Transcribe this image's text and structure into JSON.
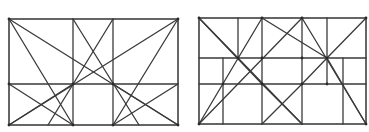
{
  "colors": {
    "line": "#3a3a3a",
    "background": "#ffffff"
  },
  "diagrams": [
    {
      "name": "left-construction-diagram",
      "frame": {
        "x": 9,
        "y": 19,
        "w": 169,
        "h": 106
      },
      "lines": [
        [
          73,
          19,
          73,
          125
        ],
        [
          113,
          19,
          113,
          125
        ],
        [
          9,
          84,
          178,
          84
        ],
        [
          9,
          19,
          178,
          125
        ],
        [
          9,
          19,
          73,
          125
        ],
        [
          178,
          19,
          9,
          125
        ],
        [
          178,
          19,
          113,
          125
        ],
        [
          73,
          19,
          139,
          125
        ],
        [
          113,
          19,
          48,
          125
        ],
        [
          9,
          84,
          73,
          125
        ],
        [
          73,
          84,
          9,
          125
        ],
        [
          113,
          84,
          178,
          125
        ],
        [
          178,
          84,
          113,
          125
        ]
      ],
      "dots": [
        [
          9,
          19
        ],
        [
          178,
          19
        ],
        [
          73,
          84
        ],
        [
          113,
          84
        ],
        [
          9,
          84
        ],
        [
          73,
          125
        ],
        [
          113,
          125
        ],
        [
          9,
          125
        ],
        [
          178,
          125
        ]
      ]
    },
    {
      "name": "right-construction-diagram",
      "frame": {
        "x": 199,
        "y": 18,
        "w": 167,
        "h": 106
      },
      "lines": [
        [
          238,
          18,
          238,
          58
        ],
        [
          262,
          18,
          262,
          124
        ],
        [
          302,
          18,
          302,
          124
        ],
        [
          327,
          18,
          327,
          84
        ],
        [
          199,
          58,
          366,
          58
        ],
        [
          199,
          84,
          366,
          84
        ],
        [
          223,
          58,
          223,
          124
        ],
        [
          343,
          58,
          343,
          124
        ],
        [
          199,
          18,
          262,
          84
        ],
        [
          199,
          18,
          238,
          58
        ],
        [
          262,
          18,
          199,
          124
        ],
        [
          262,
          18,
          327,
          58
        ],
        [
          302,
          18,
          199,
          124
        ],
        [
          302,
          18,
          366,
          124
        ],
        [
          366,
          18,
          327,
          58
        ],
        [
          327,
          58,
          302,
          84
        ],
        [
          262,
          84,
          302,
          124
        ],
        [
          302,
          84,
          262,
          124
        ],
        [
          238,
          58,
          302,
          124
        ],
        [
          327,
          58,
          366,
          124
        ]
      ],
      "dots": [
        [
          199,
          18
        ],
        [
          262,
          18
        ],
        [
          302,
          18
        ],
        [
          366,
          18
        ],
        [
          238,
          58
        ],
        [
          262,
          58
        ],
        [
          302,
          58
        ],
        [
          327,
          58
        ],
        [
          223,
          84
        ],
        [
          262,
          84
        ],
        [
          302,
          84
        ],
        [
          327,
          84
        ],
        [
          199,
          124
        ],
        [
          366,
          124
        ]
      ]
    }
  ]
}
